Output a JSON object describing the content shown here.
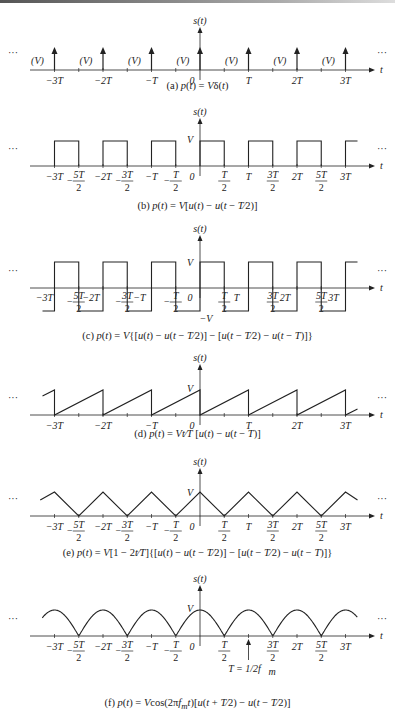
{
  "figure": {
    "axis": {
      "center_x": 200,
      "T_px": 48.5,
      "x_start": 30,
      "x_end": 372,
      "y_label": "s(t)",
      "x_label": "t",
      "ellipsis": "..."
    },
    "line_color": "#222222"
  },
  "panels": [
    {
      "id": "a",
      "axis_y": 70,
      "caption": "(a) p(t) = Vδ(t)",
      "waveform": "impulse-train",
      "amplitude_label": "(V)",
      "tick_labels": [
        "−3T",
        "−2T",
        "−T",
        "0",
        "T",
        "2T",
        "3T"
      ]
    },
    {
      "id": "b",
      "axis_y": 166,
      "caption": "(b) p(t) = V[u(t) − u(t − T/2)]",
      "waveform": "rectangular-pulse-train",
      "amplitude_label": "V",
      "tick_labels": [
        "−3T",
        "−5T/2",
        "−2T",
        "−3T/2",
        "−T",
        "−T/2",
        "0",
        "T/2",
        "T",
        "3T/2",
        "2T",
        "5T/2",
        "3T"
      ]
    },
    {
      "id": "c",
      "axis_y": 288,
      "caption": "(c) p(t) = V{[u(t) − u(t − T/2)] − [u(t − T/2) − u(t − T)]}",
      "waveform": "bipolar-square-wave",
      "amplitude_label": "V",
      "neg_amplitude_label": "−V",
      "tick_labels": [
        "−3T",
        "−5T/2",
        "−2T",
        "−3T/2",
        "−T",
        "−T/2",
        "0",
        "T/2",
        "T",
        "3T/2",
        "2T",
        "5T/2",
        "3T"
      ]
    },
    {
      "id": "d",
      "axis_y": 415,
      "caption": "(d) p(t) = Vt/T [u(t) − u(t − T)]",
      "waveform": "sawtooth",
      "amplitude_label": "V",
      "tick_labels": [
        "−3T",
        "−2T",
        "−T",
        "0",
        "T",
        "2T",
        "3T"
      ]
    },
    {
      "id": "e",
      "axis_y": 516,
      "caption": "(e) p(t) = V[1 − 2t/T]{[u(t) − u(t − T/2)] − [u(t − T/2) − u(t − T)]}",
      "waveform": "triangle",
      "amplitude_label": "V",
      "tick_labels": [
        "−3T",
        "−5T/2",
        "−2T",
        "−3T/2",
        "−T",
        "−T/2",
        "0",
        "T/2",
        "T",
        "3T/2",
        "2T",
        "5T/2",
        "3T"
      ]
    },
    {
      "id": "f",
      "axis_y": 636,
      "caption": "(f) p(t) = Vcos(2πf_m t)[u(t + T/2) − u(t − T/2)]",
      "waveform": "rectified-cosine",
      "amplitude_label": "V",
      "annotation": "T = 1/2f_m",
      "tick_labels": [
        "−3T",
        "−5T/2",
        "−2T",
        "−3T/2",
        "−T",
        "−T/2",
        "0",
        "T/2",
        "T",
        "3T/2",
        "2T",
        "5T/2",
        "3T"
      ]
    }
  ],
  "captions_html": {
    "a": "(a) <i>p</i>(<i>t</i>) = <i>V</i>δ(<i>t</i>)",
    "b": "(b) <i>p</i>(<i>t</i>) = <i>V</i>[<i>u</i>(<i>t</i>) − <i>u</i>(<i>t</i> − <i>T</i>⁄2)]",
    "c": "(c) <i>p</i>(<i>t</i>) = <i>V</i>{[<i>u</i>(<i>t</i>) − <i>u</i>(<i>t</i> − <i>T</i>⁄2)] − [<i>u</i>(<i>t</i> − <i>T</i>⁄2) − <i>u</i>(<i>t</i> − <i>T</i>)]}",
    "d": "(d) <i>p</i>(<i>t</i>) = <i>Vt</i>⁄<i>T</i> [<i>u</i>(<i>t</i>) − <i>u</i>(<i>t</i> − <i>T</i>)]",
    "e": "(e) <i>p</i>(<i>t</i>) = <i>V</i>[1 − 2<i>t</i>⁄<i>T</i>]{[<i>u</i>(<i>t</i>) − <i>u</i>(<i>t</i> − <i>T</i>⁄2)] − [<i>u</i>(<i>t</i> − <i>T</i>⁄2) − <i>u</i>(<i>t</i> − <i>T</i>)]}",
    "f": "(f) <i>p</i>(<i>t</i>) = <i>V</i>cos(2π<i>f<sub>m</sub>t</i>)[<i>u</i>(<i>t</i> + <i>T</i>⁄2) − <i>u</i>(<i>t</i> − <i>T</i>⁄2)]"
  }
}
